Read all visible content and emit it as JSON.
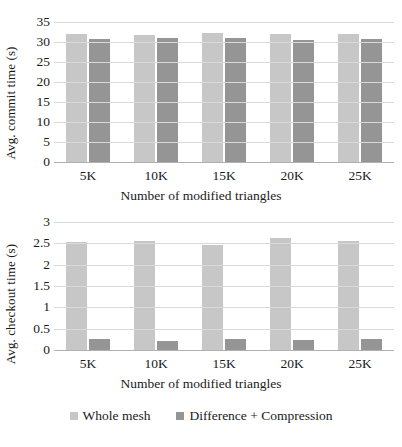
{
  "colors": {
    "series0": "#c7c7c7",
    "series1": "#959595",
    "gridline": "#d9d9d9",
    "axis": "#b0b0b0",
    "text": "#1a1a1a",
    "background": "#ffffff"
  },
  "legend": {
    "position": "bottom",
    "items": [
      {
        "label": "Whole mesh",
        "color": "#c7c7c7"
      },
      {
        "label": "Difference + Compression",
        "color": "#959595"
      }
    ]
  },
  "chart_data": [
    {
      "type": "bar",
      "id": "commit-time",
      "title": "",
      "xlabel": "Number of modified triangles",
      "ylabel": "Avg. commit time (s)",
      "categories": [
        "5K",
        "10K",
        "15K",
        "20K",
        "25K"
      ],
      "yticks": [
        "0",
        "5",
        "10",
        "15",
        "20",
        "25",
        "30",
        "35"
      ],
      "ylim": [
        0,
        35
      ],
      "grid": true,
      "series": [
        {
          "name": "Whole mesh",
          "color": "#c7c7c7",
          "values": [
            32.0,
            31.7,
            32.2,
            32.1,
            32.0
          ]
        },
        {
          "name": "Difference + Compression",
          "color": "#959595",
          "values": [
            30.7,
            31.0,
            31.0,
            30.6,
            30.7
          ]
        }
      ]
    },
    {
      "type": "bar",
      "id": "checkout-time",
      "title": "",
      "xlabel": "Number of modified triangles",
      "ylabel": "Avg. checkout time (s)",
      "categories": [
        "5K",
        "10K",
        "15K",
        "20K",
        "25K"
      ],
      "yticks": [
        "0",
        "0.5",
        "1",
        "1.5",
        "2",
        "2.5",
        "3"
      ],
      "ylim": [
        0,
        3
      ],
      "grid": true,
      "series": [
        {
          "name": "Whole mesh",
          "color": "#c7c7c7",
          "values": [
            2.54,
            2.55,
            2.45,
            2.63,
            2.55
          ]
        },
        {
          "name": "Difference + Compression",
          "color": "#959595",
          "values": [
            0.26,
            0.21,
            0.25,
            0.24,
            0.26
          ]
        }
      ]
    }
  ]
}
